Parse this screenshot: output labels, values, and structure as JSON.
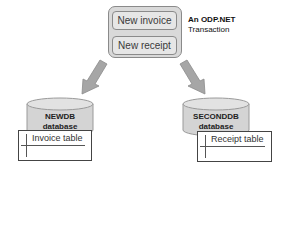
{
  "transaction": {
    "operations": [
      {
        "label": "New invoice"
      },
      {
        "label": "New receipt"
      }
    ],
    "caption_line1": "An ODP.NET",
    "caption_line2": "Transaction"
  },
  "databases": [
    {
      "name": "NEWDB",
      "suffix": "database",
      "table": "Invoice table"
    },
    {
      "name": "SECONDDB",
      "suffix": "database",
      "table": "Receipt table"
    }
  ],
  "colors": {
    "box_fill": "#d9d9d9",
    "box_border": "#8a8a8a",
    "arrow_fill": "#a6a6a6",
    "cylinder_fill": "#d4d4d4"
  }
}
